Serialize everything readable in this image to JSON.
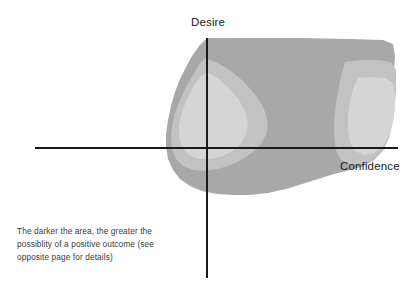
{
  "figure": {
    "background_color": "#ffffff",
    "axis_color": "#1a1a1a",
    "axes": {
      "vertical": {
        "label": "Desire",
        "name": "desire-axis",
        "x": 207,
        "y_top": 38,
        "y_bottom": 278
      },
      "horizontal": {
        "label": "Confidence",
        "name": "confidence-axis",
        "y": 148,
        "x_left": 35,
        "x_right": 398
      },
      "origin": {
        "x": 207,
        "y": 148
      }
    },
    "caption": {
      "lines": [
        "The darker the area, the greater the",
        "possiblity of a positive outcome (see",
        "opposite page for details)"
      ],
      "text_color": "#3a3a3a"
    }
  },
  "chart_data": {
    "type": "heatmap",
    "title": "",
    "subtitle": "",
    "xlabel": "Confidence",
    "ylabel": "Desire",
    "legend": [],
    "grid": false,
    "annotations": [
      "The darker the area, the greater the possiblity of a positive outcome (see opposite page for details)"
    ],
    "xlim": [
      35,
      398
    ],
    "ylim": [
      278,
      38
    ],
    "bands": [
      {
        "name": "outer-dark-band",
        "level": 3,
        "label": "darkest - greatest possibility of positive outcome",
        "color": "#a8a8a8",
        "path": "M 207 38 L 300 38 L 350 39 L 383 40 L 393 44 L 395 56 L 394 70 L 396 84 L 395 100 L 393 116 L 390 130 L 386 142 L 381 152 L 374 160 L 364 166 L 350 170 L 334 174 L 318 179 L 302 184 L 286 189 L 268 193 L 250 195 L 233 195 L 217 194 L 202 191 L 190 186 L 180 179 L 173 170 L 168 159 L 166 147 L 166 134 L 168 120 L 171 106 L 175 92 L 180 79 L 186 67 L 192 56 L 199 46 Z"
      },
      {
        "name": "mid-band",
        "level": 2,
        "label": "medium shading",
        "color": "#c2c2c2",
        "path": "M 205 58 L 218 63 L 231 71 L 243 81 L 253 92 L 261 103 L 266 114 L 268 125 L 266 135 L 261 144 L 253 152 L 243 159 L 231 165 L 218 169 L 205 171 L 193 170 L 183 166 L 176 159 L 172 149 L 171 138 L 172 126 L 175 113 L 180 100 L 186 87 L 193 75 L 199 65 Z"
      },
      {
        "name": "mid-band-right",
        "level": 2,
        "label": "medium shading right lobe",
        "color": "#c2c2c2",
        "path": "M 345 62 L 362 60 L 378 60 L 391 62 L 396 70 L 396 86 L 395 104 L 393 122 L 389 138 L 383 151 L 374 160 L 362 165 L 350 165 L 341 160 L 336 150 L 334 136 L 334 120 L 336 103 L 339 86 L 342 72 Z"
      },
      {
        "name": "inner-light-core-left",
        "level": 1,
        "label": "lightest core - lowest possibility",
        "color": "#d5d5d5",
        "path": "M 207 72 L 219 79 L 230 89 L 239 100 L 245 111 L 248 122 L 247 132 L 242 142 L 234 150 L 223 156 L 211 159 L 199 159 L 189 155 L 182 147 L 179 137 L 179 125 L 182 112 L 187 99 L 193 87 L 200 77 Z"
      },
      {
        "name": "inner-light-core-right",
        "level": 1,
        "label": "lightest core right lobe",
        "color": "#d5d5d5",
        "path": "M 358 78 L 372 77 L 385 78 L 393 83 L 395 94 L 395 108 L 393 122 L 389 135 L 383 146 L 374 153 L 364 155 L 355 151 L 350 142 L 348 130 L 348 116 L 350 102 L 353 89 Z"
      }
    ],
    "color_scale": {
      "darkest": "#a8a8a8",
      "middle": "#c2c2c2",
      "lightest": "#d5d5d5",
      "meaning": "darker = greater possibility of a positive outcome"
    }
  }
}
